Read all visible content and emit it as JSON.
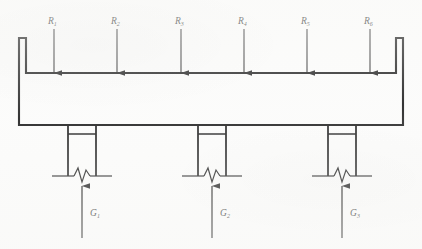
{
  "figure": {
    "background_color": "#fbfbfa",
    "line_color": "#000000"
  },
  "beam": {
    "name": "channel-beam",
    "description": "channel section beam with upturned end flanges",
    "left": 19,
    "right": 403,
    "top_flange_y": 38,
    "web_top_y": 73,
    "bottom_y": 125
  },
  "loads": {
    "direction": "down",
    "items": [
      {
        "symbol": "R",
        "subscript": "1",
        "label": "R1",
        "x": 54
      },
      {
        "symbol": "R",
        "subscript": "2",
        "label": "R2",
        "x": 117
      },
      {
        "symbol": "R",
        "subscript": "3",
        "label": "R3",
        "x": 181
      },
      {
        "symbol": "R",
        "subscript": "4",
        "label": "R4",
        "x": 244
      },
      {
        "symbol": "R",
        "subscript": "5",
        "label": "R5",
        "x": 307
      },
      {
        "symbol": "R",
        "subscript": "6",
        "label": "R6",
        "x": 370
      }
    ]
  },
  "supports": {
    "direction": "up",
    "items": [
      {
        "symbol": "G",
        "subscript": "1",
        "label": "G1",
        "x": 82,
        "left": 68,
        "right": 96
      },
      {
        "symbol": "G",
        "subscript": "2",
        "label": "G2",
        "x": 212,
        "left": 198,
        "right": 226
      },
      {
        "symbol": "G",
        "subscript": "3",
        "label": "G3",
        "x": 342,
        "left": 328,
        "right": 356
      }
    ],
    "ground_y": 176,
    "cap_y": 134
  }
}
